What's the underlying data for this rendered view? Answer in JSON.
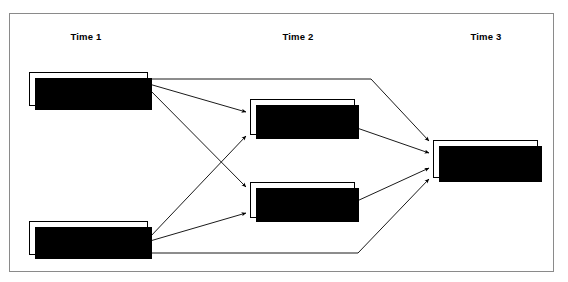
{
  "figure": {
    "type": "path-model-diagram",
    "border_color": "#8a8a8a",
    "background": "#ffffff",
    "box_fill": "#ffffff",
    "box_border": "#000000",
    "shadow_color": "#000000",
    "arrow_color": "#000000"
  },
  "columns": [
    {
      "id": "time1",
      "label": "Time 1"
    },
    {
      "id": "time2",
      "label": "Time 2"
    },
    {
      "id": "time3",
      "label": "Time 3"
    }
  ],
  "nodes": [
    {
      "id": "self-rejection",
      "label": "Self-Rejection",
      "column": "time1",
      "x": 29,
      "y": 72,
      "w": 119,
      "h": 34
    },
    {
      "id": "deviant-behavior-t1",
      "label": "Deviant Behavior",
      "column": "time1",
      "x": 29,
      "y": 221,
      "w": 119,
      "h": 34
    },
    {
      "id": "disposition-to-deviance",
      "label": "Disposition\nto Deviance",
      "line1": "Disposition",
      "line2": "to Deviance",
      "column": "time2",
      "x": 250,
      "y": 99,
      "w": 105,
      "h": 36
    },
    {
      "id": "deviant-peer-associations",
      "label": "Deviant Peer\nAssociations",
      "line1": "Deviant Peer",
      "line2": "Associations",
      "column": "time2",
      "x": 250,
      "y": 182,
      "w": 105,
      "h": 36
    },
    {
      "id": "deviant-behavior-t3",
      "label": "Deviant\nBehavior",
      "line1": "Deviant",
      "line2": "Behavior",
      "column": "time3",
      "x": 433,
      "y": 140,
      "w": 105,
      "h": 38
    }
  ],
  "edges": [
    {
      "id": "selfrej-to-disposition",
      "from": "self-rejection",
      "to": "disposition-to-deviance",
      "arrowhead": true
    },
    {
      "id": "selfrej-to-peers",
      "from": "self-rejection",
      "to": "deviant-peer-associations",
      "arrowhead": true
    },
    {
      "id": "selfrej-to-deviantbehavior-t3",
      "from": "self-rejection",
      "to": "deviant-behavior-t3",
      "arrowhead": true,
      "routing": "orthogonal-top"
    },
    {
      "id": "devbeh1-to-disposition",
      "from": "deviant-behavior-t1",
      "to": "disposition-to-deviance",
      "arrowhead": true
    },
    {
      "id": "devbeh1-to-peers",
      "from": "deviant-behavior-t1",
      "to": "deviant-peer-associations",
      "arrowhead": true
    },
    {
      "id": "devbeh1-to-deviantbehavior-t3",
      "from": "deviant-behavior-t1",
      "to": "deviant-behavior-t3",
      "arrowhead": true,
      "routing": "orthogonal-bottom"
    },
    {
      "id": "disposition-to-deviantbehavior-t3",
      "from": "disposition-to-deviance",
      "to": "deviant-behavior-t3",
      "arrowhead": true
    },
    {
      "id": "peers-to-deviantbehavior-t3",
      "from": "deviant-peer-associations",
      "to": "deviant-behavior-t3",
      "arrowhead": true
    }
  ]
}
